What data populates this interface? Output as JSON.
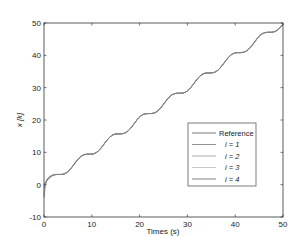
{
  "chart_data": {
    "type": "line",
    "title": "",
    "xlabel": "Times (s)",
    "ylabel": "x [k]",
    "xlim": [
      0,
      50
    ],
    "ylim": [
      -10,
      50
    ],
    "xticks": [
      0,
      10,
      20,
      30,
      40,
      50
    ],
    "yticks": [
      -10,
      0,
      10,
      20,
      30,
      40,
      50
    ],
    "grid": false,
    "legend_position": "lower right",
    "legend": [
      "Reference",
      "i = 1",
      "i = 2",
      "i = 3",
      "i = 4"
    ],
    "series": [
      {
        "name": "Reference",
        "color": "#555555",
        "x": [
          0,
          3,
          6,
          9,
          12,
          15,
          18,
          21,
          24,
          27,
          30,
          33,
          36,
          39,
          42,
          45,
          48,
          50
        ],
        "values": [
          0,
          3.1,
          5.7,
          9.4,
          11.5,
          15.7,
          17.2,
          21.8,
          23.1,
          28,
          29,
          32,
          35,
          39,
          41.1,
          46,
          47.2,
          49.7
        ]
      },
      {
        "name": "i = 1",
        "color": "#777777",
        "x": [
          0,
          0.5,
          1,
          2,
          3,
          6,
          9,
          12,
          15,
          18,
          21,
          24,
          27,
          30,
          33,
          36,
          39,
          42,
          45,
          48,
          50
        ],
        "values": [
          -4,
          3,
          4.8,
          3.6,
          3.1,
          5.7,
          9.4,
          11.5,
          15.7,
          17.2,
          21.8,
          23.1,
          28,
          29,
          32,
          35,
          39,
          41.1,
          46,
          47.2,
          49.7
        ]
      },
      {
        "name": "i = 2",
        "color": "#999999",
        "x": [
          0,
          0.5,
          1,
          2,
          3,
          6,
          9,
          12,
          15,
          18,
          21,
          24,
          27,
          30,
          33,
          36,
          39,
          42,
          45,
          48,
          50
        ],
        "values": [
          -3,
          2.5,
          4.3,
          3.4,
          3.1,
          5.7,
          9.4,
          11.5,
          15.7,
          17.2,
          21.8,
          23.1,
          28,
          29,
          32,
          35,
          39,
          41.1,
          46,
          47.2,
          49.7
        ]
      },
      {
        "name": "i = 3",
        "color": "#bbbbbb",
        "x": [
          0,
          0.5,
          1,
          2,
          3,
          6,
          9,
          12,
          15,
          18,
          21,
          24,
          27,
          30,
          33,
          36,
          39,
          42,
          45,
          48,
          50
        ],
        "values": [
          -2,
          2,
          3.8,
          3.3,
          3.1,
          5.7,
          9.4,
          11.5,
          15.7,
          17.2,
          21.8,
          23.1,
          28,
          29,
          32,
          35,
          39,
          41.1,
          46,
          47.2,
          49.7
        ]
      },
      {
        "name": "i = 4",
        "color": "#666666",
        "x": [
          0,
          0.5,
          1,
          2,
          3,
          6,
          9,
          12,
          15,
          18,
          21,
          24,
          27,
          30,
          33,
          36,
          39,
          42,
          45,
          48,
          50
        ],
        "values": [
          -1,
          1.5,
          3.2,
          3.2,
          3.1,
          5.7,
          9.4,
          11.5,
          15.7,
          17.2,
          21.8,
          23.1,
          28,
          29,
          32,
          35,
          39,
          41.1,
          46,
          47.2,
          49.7
        ]
      }
    ]
  }
}
